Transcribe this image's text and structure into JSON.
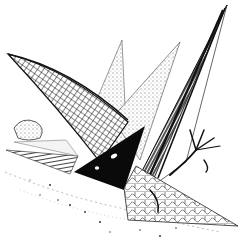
{
  "artwork": {
    "description": "Pen-and-ink illustration of angular sail-like shards with hatched, scaled textures over a rocky ground",
    "colors": {
      "ink": "#111111",
      "paper": "#ffffff",
      "shade": "#cfcfcf"
    },
    "elements": [
      {
        "name": "large-hatched-wing",
        "texture": "cross-hatched grid"
      },
      {
        "name": "tall-dark-spike",
        "texture": "dense vertical strokes"
      },
      {
        "name": "pale-sail",
        "texture": "light stippling"
      },
      {
        "name": "black-triangle",
        "detail": "two white eye-like dots"
      },
      {
        "name": "scaled-lower-wing",
        "texture": "cracked scale pattern"
      },
      {
        "name": "clawed-branch",
        "texture": "twig-like claws"
      },
      {
        "name": "rocky-ground",
        "texture": "scattered stipple"
      }
    ]
  }
}
